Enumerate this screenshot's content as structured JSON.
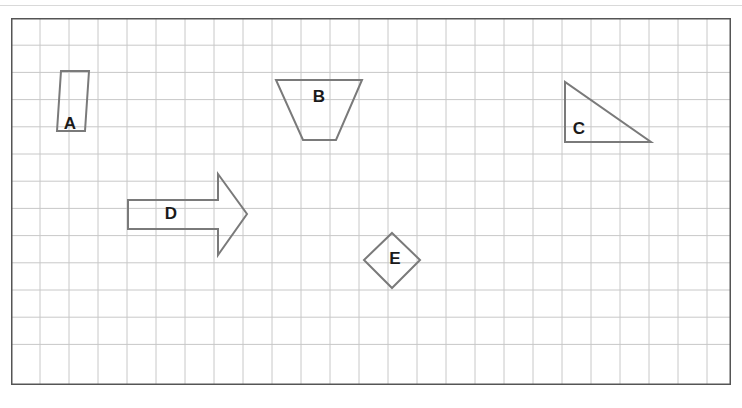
{
  "document": {
    "title": "Grid worksheet with labelled geometric shapes",
    "type": "geometry-worksheet"
  },
  "colors": {
    "page_background": "#ffffff",
    "top_rule": "#d9d9d9",
    "grid_border": "#555555",
    "grid_line": "#c8c8c8",
    "shape_stroke": "#7a7a7a",
    "label_text": "#1a1a1a"
  },
  "grid": {
    "border_x": 11,
    "border_y": 18,
    "width": 720,
    "height": 367,
    "cell_width": 29,
    "cell_height": 27.2,
    "columns": 25,
    "rows": 13,
    "show_grid": true
  },
  "shapes": [
    {
      "id": "shape-a",
      "label": "A",
      "type": "parallelogram",
      "points": "46,113 50,53 78,53 74,113",
      "label_x": 59,
      "label_y": 107
    },
    {
      "id": "shape-b",
      "label": "B",
      "type": "trapezoid",
      "points": "265,62 351,62 325,122 292,122",
      "label_x": 308,
      "label_y": 80
    },
    {
      "id": "shape-c",
      "label": "C",
      "type": "right-triangle",
      "points": "554,64 554,124 640,124",
      "label_x": 568,
      "label_y": 112
    },
    {
      "id": "shape-d",
      "label": "D",
      "type": "block-arrow-right",
      "points": "117,182 207,182 207,156 236,196 207,237 207,211 117,211",
      "label_x": 160,
      "label_y": 197
    },
    {
      "id": "shape-e",
      "label": "E",
      "type": "rhombus",
      "points": "381,215 409,242 381,270 353,242",
      "label_x": 384,
      "label_y": 242
    }
  ]
}
